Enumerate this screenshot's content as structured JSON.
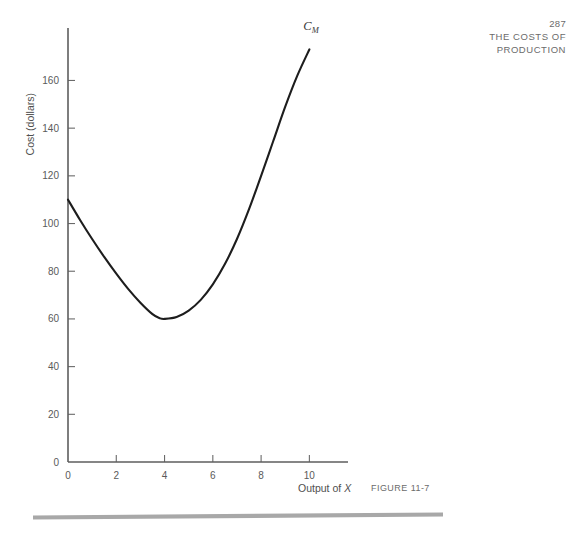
{
  "page_header": {
    "page_number": "287",
    "running_head": [
      "THE COSTS OF",
      "PRODUCTION"
    ]
  },
  "figure": {
    "figure_number": "FIGURE  11-7",
    "curve_label_main": "C",
    "curve_label_subscript": "M",
    "y_axis_title": "Cost (dollars)",
    "x_axis_title_prefix": "Output of ",
    "x_axis_title_variable": "X"
  },
  "colors": {
    "background": "#ffffff",
    "curve": "#1d1d1d",
    "axis": "#5e5e5e",
    "tick_label": "#5a5a5a",
    "header_text": "#6b6b6b",
    "bottom_rule": "#a8a8a8"
  },
  "chart_data": {
    "type": "line",
    "title": "",
    "subtitle": "",
    "xlabel": "Output of X",
    "ylabel": "Cost (dollars)",
    "xlim": [
      0,
      11.6
    ],
    "ylim": [
      0,
      182
    ],
    "grid": false,
    "legend": "inline-curve-label",
    "legend_entries": [
      "C_M"
    ],
    "xticks": [
      0,
      2,
      4,
      6,
      8,
      10
    ],
    "xtick_labels": [
      "0",
      "2",
      "4",
      "6",
      "8",
      "10"
    ],
    "yticks": [
      0,
      20,
      40,
      60,
      80,
      100,
      120,
      140,
      160
    ],
    "ytick_labels": [
      "0",
      "20",
      "40",
      "60",
      "80",
      "100",
      "120",
      "140",
      "160"
    ],
    "annotations": [
      {
        "text": "C_M",
        "x": 9.75,
        "y": 181,
        "note": "marginal cost curve label"
      }
    ],
    "series": [
      {
        "name": "C_M",
        "note": "U-shaped marginal cost curve; minimum about 60 dollars at output 3.8",
        "x": [
          0.0,
          0.5,
          1.0,
          1.5,
          2.0,
          2.5,
          3.0,
          3.5,
          3.8,
          4.0,
          4.5,
          5.0,
          5.5,
          6.0,
          6.5,
          7.0,
          7.5,
          8.0,
          8.5,
          9.0,
          9.5,
          10.0
        ],
        "y": [
          110.0,
          101.5,
          93.5,
          86.0,
          79.0,
          72.5,
          66.8,
          62.0,
          60.3,
          60.0,
          60.8,
          63.5,
          68.0,
          74.5,
          83.0,
          93.5,
          106.0,
          120.0,
          134.5,
          149.0,
          162.0,
          173.0
        ],
        "minimum": {
          "x": 3.8,
          "y": 60
        },
        "start": {
          "x": 0,
          "y": 110
        },
        "end": {
          "x": 10,
          "y": 173
        }
      }
    ]
  }
}
